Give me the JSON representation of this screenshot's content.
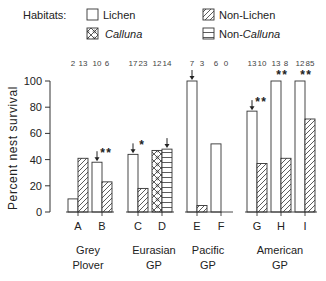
{
  "legend": {
    "title": "Habitats:",
    "items": [
      {
        "label": "Lichen",
        "pattern": "open",
        "italic": false
      },
      {
        "label": "Calluna",
        "pattern": "crosshatch",
        "italic": true
      },
      {
        "label": "Non-Lichen",
        "pattern": "diagonal",
        "italic": false
      },
      {
        "label": "Non-Calluna",
        "pattern": "horizontal",
        "italic": "partial"
      }
    ]
  },
  "chart_data": {
    "type": "bar",
    "title": "",
    "xlabel": "",
    "ylabel": "Percent nest survival",
    "ylim": [
      0,
      100
    ],
    "yticks": [
      0,
      20,
      40,
      60,
      80,
      100
    ],
    "grid": false,
    "legend_position": "top",
    "categories": [
      "A",
      "B",
      "C",
      "D",
      "E",
      "F",
      "G",
      "H",
      "I"
    ],
    "groups": [
      {
        "label": "Grey\nPlover",
        "categories": [
          "A",
          "B"
        ]
      },
      {
        "label": "Eurasian\nGP",
        "categories": [
          "C",
          "D"
        ]
      },
      {
        "label": "Pacific\nGP",
        "categories": [
          "E",
          "F"
        ]
      },
      {
        "label": "American\nGP",
        "categories": [
          "G",
          "H",
          "I"
        ]
      }
    ],
    "bars": [
      {
        "category": "A",
        "first": {
          "habitat": "Lichen",
          "value": 10,
          "n": 2
        },
        "second": {
          "habitat": "Non-Lichen",
          "value": 41,
          "n": 13
        },
        "annotation": "",
        "arrow": false
      },
      {
        "category": "B",
        "first": {
          "habitat": "Lichen",
          "value": 38,
          "n": 10
        },
        "second": {
          "habitat": "Non-Lichen",
          "value": 23,
          "n": 6
        },
        "annotation": "**",
        "arrow": "first"
      },
      {
        "category": "C",
        "first": {
          "habitat": "Lichen",
          "value": 44,
          "n": 17
        },
        "second": {
          "habitat": "Non-Lichen",
          "value": 18,
          "n": 23
        },
        "annotation": "*",
        "arrow": "first"
      },
      {
        "category": "D",
        "first": {
          "habitat": "Calluna",
          "value": 47,
          "n": 12
        },
        "second": {
          "habitat": "Non-Calluna",
          "value": 48,
          "n": 14
        },
        "annotation": "",
        "arrow": "second"
      },
      {
        "category": "E",
        "first": {
          "habitat": "Lichen",
          "value": 100,
          "n": 7
        },
        "second": {
          "habitat": "Non-Lichen",
          "value": 5,
          "n": 3
        },
        "annotation": "",
        "arrow": "first"
      },
      {
        "category": "F",
        "first": {
          "habitat": "Lichen",
          "value": 52,
          "n": 6
        },
        "second": {
          "habitat": "Non-Lichen",
          "value": 0,
          "n": 0
        },
        "annotation": "",
        "arrow": false
      },
      {
        "category": "G",
        "first": {
          "habitat": "Lichen",
          "value": 77,
          "n": 13
        },
        "second": {
          "habitat": "Non-Lichen",
          "value": 37,
          "n": 10
        },
        "annotation": "**",
        "arrow": "first"
      },
      {
        "category": "H",
        "first": {
          "habitat": "Lichen",
          "value": 100,
          "n": 13
        },
        "second": {
          "habitat": "Non-Lichen",
          "value": 41,
          "n": 8
        },
        "annotation": "**",
        "arrow": false
      },
      {
        "category": "I",
        "first": {
          "habitat": "Lichen",
          "value": 100,
          "n": 12
        },
        "second": {
          "habitat": "Non-Lichen",
          "value": 71,
          "n": 85
        },
        "annotation": "**",
        "arrow": false
      }
    ],
    "sample_sizes": [
      "2",
      "13",
      "10",
      "6",
      "17",
      "23",
      "12",
      "14",
      "7",
      "3",
      "6",
      "0",
      "13",
      "10",
      "13",
      "8",
      "12",
      "85"
    ]
  }
}
